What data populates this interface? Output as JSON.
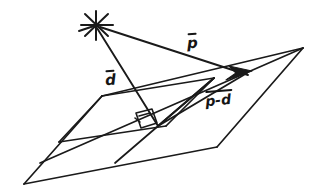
{
  "figure": {
    "kind": "hand-drawn-geometry-diagram",
    "background_color": "#ffffff",
    "ink_color": "#1a1a1a",
    "width": 317,
    "height": 192
  },
  "labels": {
    "p": "p",
    "d": "d",
    "p_minus_d": "p-d"
  },
  "annotations": {
    "right_angle_marker": "right-angle",
    "origin_marker": "asterisk-star-point"
  },
  "geometry": {
    "star_point": [
      96,
      24
    ],
    "foot_point": [
      158,
      126
    ],
    "arrow_tip": [
      246,
      72
    ],
    "outer_plane": [
      [
        24,
        184
      ],
      [
        102,
        96
      ],
      [
        303,
        48
      ],
      [
        217,
        147
      ]
    ],
    "inner_parallelogram": [
      [
        59,
        142
      ],
      [
        102,
        96
      ],
      [
        214,
        78
      ],
      [
        166,
        126
      ]
    ],
    "mid_line_left": [
      24,
      184
    ],
    "mid_line_right": [
      303,
      48
    ]
  }
}
